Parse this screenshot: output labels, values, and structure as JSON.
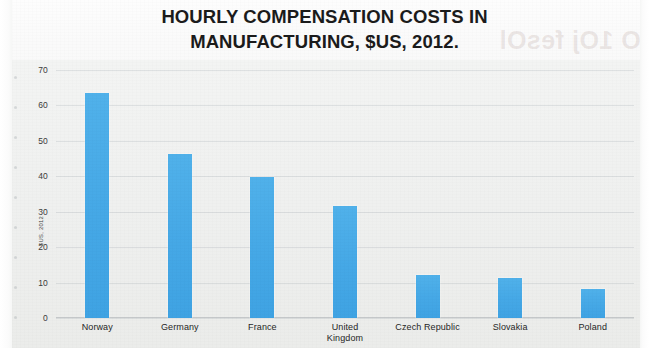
{
  "chart_data": {
    "type": "bar",
    "title": "HOURLY COMPENSATION COSTS IN MANUFACTURING, $US, 2012.",
    "title_lines": [
      "HOURLY COMPENSATION COSTS IN",
      "MANUFACTURING, $US, 2012."
    ],
    "categories": [
      "Norway",
      "Germany",
      "France",
      "United Kingdom",
      "Czech Republic",
      "Slovakia",
      "Poland"
    ],
    "category_lines": [
      [
        "Norway"
      ],
      [
        "Germany"
      ],
      [
        "France"
      ],
      [
        "United",
        "Kingdom"
      ],
      [
        "Czech Republic"
      ],
      [
        "Slovakia"
      ],
      [
        "Poland"
      ]
    ],
    "values": [
      63.4,
      46.2,
      39.8,
      31.5,
      12.2,
      11.4,
      8.2
    ],
    "xlabel": "",
    "ylabel": "$US, 2012",
    "ylim": [
      0,
      70
    ],
    "yticks": [
      70,
      60,
      50,
      40,
      30,
      20,
      10,
      0
    ],
    "ytick_labels": [
      "70",
      "60",
      "50",
      "40",
      "30",
      "20",
      "10",
      "0"
    ],
    "grid": true,
    "legend": false,
    "series_color": "#45A8E6",
    "plot_background": "#EFF0EF"
  },
  "figure": {
    "watermark_text": "O 1Oj fesOl",
    "background": "#FFFFFF"
  }
}
